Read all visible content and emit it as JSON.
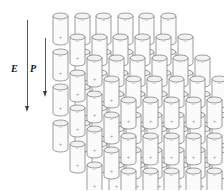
{
  "figure": {
    "background_color": "#ffffff"
  },
  "field_vectors": [
    {
      "name": "electric-field",
      "label": "E",
      "direction": "down",
      "x": 27,
      "shaft_top": 20,
      "shaft_bottom": 112,
      "label_x": 11,
      "label_y": 64,
      "color": "#555a5e"
    },
    {
      "name": "polarization",
      "label": "P",
      "direction": "down",
      "x": 45,
      "shaft_top": 38,
      "shaft_bottom": 97,
      "label_x": 30,
      "label_y": 64,
      "color": "#555a5e"
    }
  ],
  "lattice": {
    "description": "Three-dimensional array of cylindrical electric dipoles, each with negative charge at the top face and positive charge at the bottom face, all aligned antiparallel to the applied field.",
    "columns": 6,
    "depth_layers": 5,
    "vertical_rows": 4,
    "cylinder": {
      "width": 15,
      "body_height": 26,
      "cap_height": 6,
      "fill_color": "#fbfbfb",
      "cap_fill_color": "#f2f2f2",
      "stroke_color": "#6e7377",
      "stroke_width": 0.7
    },
    "spacing": {
      "column_step_x": 21.5,
      "row_step_y": 35.5,
      "depth_step_x": 17,
      "depth_step_y": 21
    },
    "origin": {
      "x": 52,
      "y": 12
    },
    "charges": {
      "top_symbol": "−",
      "bottom_symbol": "+",
      "symbol_color": "#9a9ea1",
      "symbol_size": 5
    }
  },
  "chart_data": {
    "type": "diagram",
    "annotations": [
      "E",
      "P"
    ],
    "grid": false,
    "legend": "none"
  }
}
